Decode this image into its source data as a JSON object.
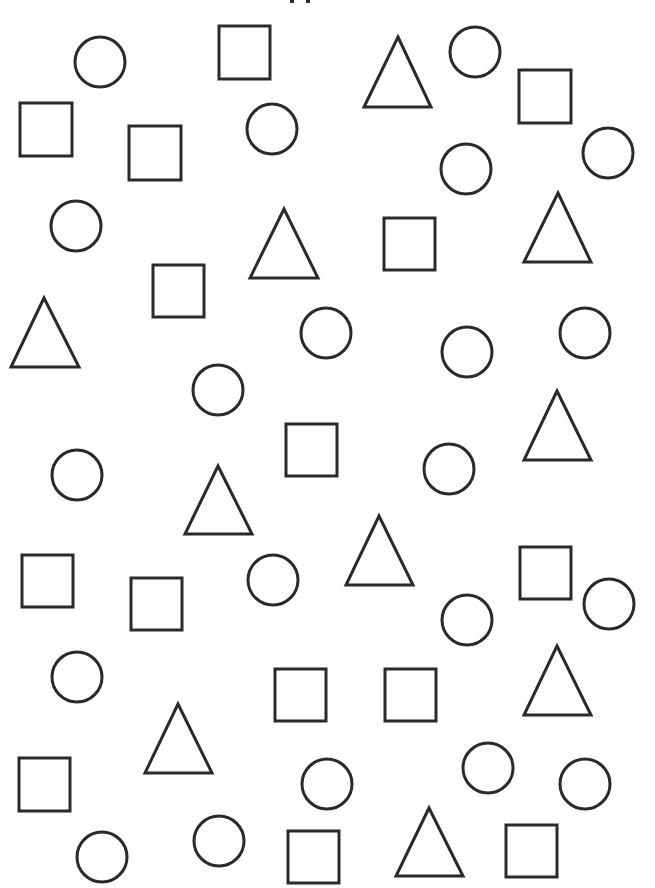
{
  "page": {
    "width": 655,
    "height": 888,
    "background": "#ffffff",
    "stroke_color": "#2a2a2a",
    "stroke_width": 3
  },
  "title": {
    "text": "",
    "note": "title is clipped at top edge; only bottom descender fragments visible"
  },
  "shape_counts": {
    "circle": 21,
    "square": 15,
    "triangle": 10,
    "total": 46
  },
  "shapes": {
    "circles": [
      {
        "cx": 100,
        "cy": 62,
        "r": 25
      },
      {
        "cx": 475,
        "cy": 52,
        "r": 25
      },
      {
        "cx": 272,
        "cy": 129,
        "r": 25
      },
      {
        "cx": 466,
        "cy": 169,
        "r": 25
      },
      {
        "cx": 608,
        "cy": 153,
        "r": 25
      },
      {
        "cx": 76,
        "cy": 226,
        "r": 25
      },
      {
        "cx": 326,
        "cy": 333,
        "r": 25
      },
      {
        "cx": 467,
        "cy": 352,
        "r": 25
      },
      {
        "cx": 585,
        "cy": 333,
        "r": 25
      },
      {
        "cx": 218,
        "cy": 390,
        "r": 25
      },
      {
        "cx": 77,
        "cy": 475,
        "r": 25
      },
      {
        "cx": 449,
        "cy": 469,
        "r": 25
      },
      {
        "cx": 273,
        "cy": 580,
        "r": 25
      },
      {
        "cx": 609,
        "cy": 604,
        "r": 25
      },
      {
        "cx": 467,
        "cy": 620,
        "r": 25
      },
      {
        "cx": 77,
        "cy": 677,
        "r": 25
      },
      {
        "cx": 327,
        "cy": 784,
        "r": 25
      },
      {
        "cx": 488,
        "cy": 768,
        "r": 25
      },
      {
        "cx": 585,
        "cy": 784,
        "r": 25
      },
      {
        "cx": 102,
        "cy": 857,
        "r": 25
      },
      {
        "cx": 219,
        "cy": 841,
        "r": 25
      }
    ],
    "squares": [
      {
        "x": 219,
        "y": 26,
        "w": 51,
        "h": 53
      },
      {
        "x": 20,
        "y": 103,
        "w": 52,
        "h": 53
      },
      {
        "x": 129,
        "y": 126,
        "w": 52,
        "h": 54
      },
      {
        "x": 519,
        "y": 70,
        "w": 52,
        "h": 53
      },
      {
        "x": 384,
        "y": 218,
        "w": 51,
        "h": 52
      },
      {
        "x": 153,
        "y": 265,
        "w": 51,
        "h": 52
      },
      {
        "x": 286,
        "y": 424,
        "w": 51,
        "h": 52
      },
      {
        "x": 22,
        "y": 555,
        "w": 51,
        "h": 52
      },
      {
        "x": 131,
        "y": 578,
        "w": 51,
        "h": 52
      },
      {
        "x": 520,
        "y": 547,
        "w": 51,
        "h": 52
      },
      {
        "x": 275,
        "y": 669,
        "w": 51,
        "h": 52
      },
      {
        "x": 385,
        "y": 669,
        "w": 51,
        "h": 52
      },
      {
        "x": 19,
        "y": 758,
        "w": 51,
        "h": 53
      },
      {
        "x": 288,
        "y": 831,
        "w": 51,
        "h": 52
      },
      {
        "x": 506,
        "y": 825,
        "w": 51,
        "h": 52
      }
    ],
    "triangles": [
      {
        "apex_x": 398,
        "apex_y": 37,
        "base_y": 107,
        "left_x": 364,
        "right_x": 431
      },
      {
        "apex_x": 284,
        "apex_y": 209,
        "base_y": 278,
        "left_x": 250,
        "right_x": 318
      },
      {
        "apex_x": 558,
        "apex_y": 193,
        "base_y": 262,
        "left_x": 524,
        "right_x": 591
      },
      {
        "apex_x": 44,
        "apex_y": 298,
        "base_y": 367,
        "left_x": 11,
        "right_x": 79
      },
      {
        "apex_x": 557,
        "apex_y": 391,
        "base_y": 460,
        "left_x": 524,
        "right_x": 591
      },
      {
        "apex_x": 218,
        "apex_y": 466,
        "base_y": 534,
        "left_x": 185,
        "right_x": 252
      },
      {
        "apex_x": 379,
        "apex_y": 516,
        "base_y": 585,
        "left_x": 346,
        "right_x": 413
      },
      {
        "apex_x": 557,
        "apex_y": 646,
        "base_y": 715,
        "left_x": 524,
        "right_x": 591
      },
      {
        "apex_x": 178,
        "apex_y": 704,
        "base_y": 773,
        "left_x": 145,
        "right_x": 212
      },
      {
        "apex_x": 429,
        "apex_y": 808,
        "base_y": 876,
        "left_x": 396,
        "right_x": 463
      }
    ]
  }
}
